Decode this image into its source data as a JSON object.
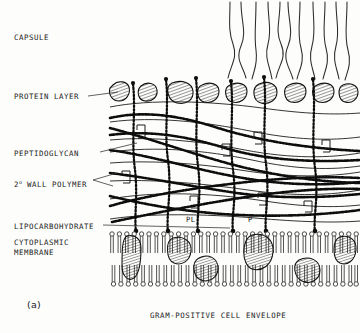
{
  "figure": {
    "panel_label": "(a)",
    "caption": "GRAM-POSITIVE CELL ENVELOPE",
    "type": "schematic-diagram",
    "style": "black-and-white line drawing"
  },
  "labels": {
    "capsule": "CAPSULE",
    "protein_layer": "PROTEIN LAYER",
    "peptidoglycan": "PEPTIDOGLYCAN",
    "wall_polymer": "2",
    "wall_polymer_sup": "o",
    "wall_polymer_rest": " WALL POLYMER",
    "lipocarbohydrate": "LIPOCARBOHYDRATE",
    "cytoplasmic_membrane_line1": "CYTOPLASMIC",
    "cytoplasmic_membrane_line2": "MEMBRANE"
  },
  "inline_labels": {
    "pl": "PL",
    "p": "P"
  },
  "colors": {
    "ink": "#111111",
    "background": "#fdfdfb",
    "leader_line": "#3a3a3a",
    "hatch": "#1a1a1a"
  },
  "layers": [
    {
      "name": "capsule",
      "description": "crossing wavy fibres above the cell surface",
      "fiber_count": 11
    },
    {
      "name": "protein-layer",
      "description": "row of hatched oval protein blobs",
      "blob_count": 9
    },
    {
      "name": "peptidoglycan",
      "description": "thick beaded strands forming a mesh with Z-shaped peptide crosslinks",
      "strand_count": 7,
      "crosslink_count": 8
    },
    {
      "name": "secondary-wall-polymer",
      "description": "thin smooth curved lines interwoven in the wall",
      "line_count": 7
    },
    {
      "name": "lipocarbohydrate",
      "description": "vertical beaded chains anchored in the membrane and reaching the surface",
      "chain_count": 6
    },
    {
      "name": "cytoplasmic-membrane",
      "description": "phospholipid bilayer with embedded hatched membrane proteins",
      "protein_count": 6
    }
  ]
}
